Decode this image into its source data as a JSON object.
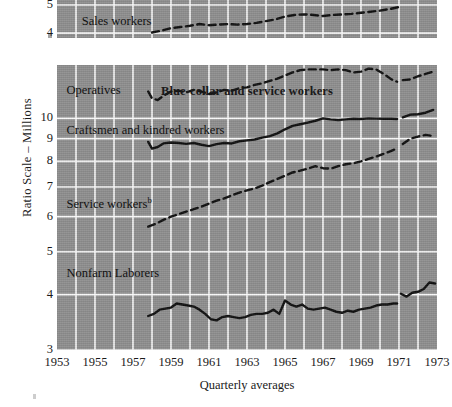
{
  "figure": {
    "y_axis_title": "Ratio Scale – Millions",
    "x_axis_caption": "Quarterly averages",
    "background_color": "#909090",
    "gridline_color": "#ffffff",
    "line_color": "#111111"
  },
  "panels": [
    {
      "id": "top",
      "title": "",
      "labels": [
        {
          "text": "Sales workers",
          "x": 1954.3,
          "y": 4.38
        }
      ],
      "y_ticks": [
        "5",
        "4"
      ],
      "y_tick_values": [
        5,
        4
      ],
      "clipped": true
    },
    {
      "id": "bottom",
      "title": "Blue-collar and service workers",
      "labels": [
        {
          "text": "Operatives",
          "x": 1953.5,
          "y": 11.55
        },
        {
          "text": "Craftsmen and kindred workers",
          "x": 1953.5,
          "y": 9.35
        },
        {
          "text": "Service workers",
          "superscript": "b",
          "x": 1953.5,
          "y": 6.45
        },
        {
          "text": "Nonfarm Laborers",
          "x": 1953.5,
          "y": 4.45
        }
      ],
      "y_ticks": [
        "10",
        "9",
        "8",
        "7",
        "6",
        "5",
        "4",
        "3"
      ],
      "y_tick_values": [
        10,
        9,
        8,
        7,
        6,
        5,
        4,
        3
      ]
    }
  ],
  "x_ticks": [
    "1953",
    "1955",
    "1957",
    "1959",
    "1961",
    "1963",
    "1965",
    "1967",
    "1969",
    "1971",
    "1973"
  ],
  "chart_data": {
    "type": "line",
    "title": "Blue-collar and service workers",
    "subtitle": "",
    "xlabel": "Quarterly averages",
    "ylabel": "Ratio Scale – Millions",
    "scale": "log",
    "grid": true,
    "legend": "inline-labels",
    "xlim": [
      1953,
      1973
    ],
    "x_ticks": [
      1953,
      1955,
      1957,
      1959,
      1961,
      1963,
      1965,
      1967,
      1969,
      1971,
      1973
    ],
    "panels": [
      {
        "name": "White-collar workers (clipped panel)",
        "ylim": [
          3.85,
          5.2
        ],
        "y_ticks": [
          4,
          5
        ],
        "series": [
          {
            "name": "Sales workers",
            "style": "dashed",
            "x": [
              1958.0,
              1958.5,
              1959.0,
              1959.5,
              1960.0,
              1960.5,
              1961.0,
              1961.5,
              1962.0,
              1962.5,
              1963.0,
              1963.5,
              1964.0,
              1964.5,
              1965.0,
              1965.5,
              1966.0,
              1966.5,
              1967.0,
              1967.5,
              1968.0,
              1968.5,
              1969.0,
              1969.5,
              1970.0,
              1970.5,
              1971.0
            ],
            "values": [
              4.02,
              4.08,
              4.16,
              4.2,
              4.24,
              4.3,
              4.26,
              4.28,
              4.3,
              4.28,
              4.3,
              4.34,
              4.4,
              4.46,
              4.56,
              4.62,
              4.64,
              4.62,
              4.58,
              4.62,
              4.64,
              4.66,
              4.7,
              4.74,
              4.78,
              4.84,
              4.92
            ]
          }
        ]
      },
      {
        "name": "Blue-collar and service workers",
        "ylim": [
          3.0,
          13.2
        ],
        "y_ticks": [
          3,
          4,
          5,
          6,
          7,
          8,
          9,
          10
        ],
        "series": [
          {
            "name": "Operatives",
            "style": "dashed",
            "break_year": 1971,
            "x": [
              1957.8,
              1958.0,
              1958.3,
              1958.6,
              1959.0,
              1959.4,
              1959.8,
              1960.2,
              1960.6,
              1961.0,
              1961.4,
              1961.8,
              1962.2,
              1962.6,
              1963.0,
              1963.4,
              1963.8,
              1964.2,
              1964.6,
              1965.0,
              1965.4,
              1965.8,
              1966.2,
              1966.6,
              1967.0,
              1967.4,
              1967.8,
              1968.2,
              1968.6,
              1969.0,
              1969.4,
              1969.8,
              1970.2,
              1970.6,
              1970.9
            ],
            "values": [
              11.5,
              11.1,
              11.0,
              11.25,
              11.5,
              11.55,
              11.45,
              11.6,
              11.5,
              11.35,
              11.45,
              11.6,
              11.55,
              11.7,
              11.75,
              11.9,
              12.0,
              12.15,
              12.3,
              12.5,
              12.7,
              12.85,
              12.9,
              12.9,
              12.9,
              12.85,
              12.9,
              12.85,
              12.7,
              12.75,
              12.95,
              12.9,
              12.6,
              12.25,
              12.1
            ],
            "x2": [
              1971.2,
              1971.6,
              1972.0,
              1972.4,
              1972.8
            ],
            "values2": [
              12.2,
              12.25,
              12.45,
              12.6,
              12.75
            ]
          },
          {
            "name": "Craftsmen and kindred workers",
            "style": "solid",
            "break_year": 1971,
            "x": [
              1957.8,
              1958.0,
              1958.3,
              1958.6,
              1959.0,
              1959.4,
              1959.8,
              1960.2,
              1960.6,
              1961.0,
              1961.4,
              1961.8,
              1962.2,
              1962.6,
              1963.0,
              1963.4,
              1963.8,
              1964.2,
              1964.6,
              1965.0,
              1965.4,
              1965.8,
              1966.2,
              1966.6,
              1967.0,
              1967.4,
              1967.8,
              1968.2,
              1968.6,
              1969.0,
              1969.4,
              1969.8,
              1970.2,
              1970.6,
              1970.9
            ],
            "values": [
              8.85,
              8.55,
              8.62,
              8.78,
              8.82,
              8.8,
              8.76,
              8.8,
              8.72,
              8.66,
              8.75,
              8.8,
              8.78,
              8.88,
              8.92,
              8.96,
              9.05,
              9.12,
              9.25,
              9.45,
              9.62,
              9.7,
              9.78,
              9.88,
              10.0,
              9.95,
              9.92,
              9.95,
              9.98,
              9.97,
              10.0,
              9.99,
              9.98,
              9.98,
              9.97
            ],
            "x2": [
              1971.2,
              1971.6,
              1972.0,
              1972.4,
              1972.8
            ],
            "values2": [
              10.05,
              10.2,
              10.22,
              10.3,
              10.45
            ]
          },
          {
            "name": "Service workers",
            "superscript": "b",
            "style": "dashed",
            "break_year": 1971,
            "x": [
              1957.8,
              1958.2,
              1958.6,
              1959.0,
              1959.4,
              1959.8,
              1960.2,
              1960.6,
              1961.0,
              1961.4,
              1961.8,
              1962.2,
              1962.6,
              1963.0,
              1963.4,
              1963.8,
              1964.2,
              1964.6,
              1965.0,
              1965.4,
              1965.8,
              1966.2,
              1966.6,
              1967.0,
              1967.4,
              1967.8,
              1968.2,
              1968.6,
              1969.0,
              1969.4,
              1969.8,
              1970.2,
              1970.6,
              1970.9
            ],
            "values": [
              5.7,
              5.78,
              5.9,
              6.0,
              6.08,
              6.16,
              6.24,
              6.32,
              6.42,
              6.52,
              6.6,
              6.7,
              6.8,
              6.88,
              6.95,
              7.05,
              7.18,
              7.3,
              7.42,
              7.55,
              7.62,
              7.7,
              7.8,
              7.72,
              7.7,
              7.8,
              7.88,
              7.92,
              8.0,
              8.1,
              8.2,
              8.32,
              8.45,
              8.55
            ],
            "x2": [
              1971.2,
              1971.6,
              1972.0,
              1972.4,
              1972.8
            ],
            "values2": [
              8.75,
              9.0,
              9.1,
              9.18,
              9.12
            ]
          },
          {
            "name": "Nonfarm Laborers",
            "style": "solid",
            "break_year": 1971,
            "x": [
              1957.8,
              1958.1,
              1958.4,
              1958.7,
              1959.0,
              1959.3,
              1959.6,
              1959.9,
              1960.2,
              1960.5,
              1960.8,
              1961.1,
              1961.4,
              1961.7,
              1962.0,
              1962.3,
              1962.6,
              1962.9,
              1963.2,
              1963.5,
              1963.8,
              1964.1,
              1964.4,
              1964.7,
              1965.0,
              1965.3,
              1965.6,
              1965.9,
              1966.2,
              1966.5,
              1966.8,
              1967.1,
              1967.4,
              1967.7,
              1968.0,
              1968.3,
              1968.6,
              1968.9,
              1969.2,
              1969.5,
              1969.8,
              1970.1,
              1970.4,
              1970.7,
              1970.9
            ],
            "values": [
              3.58,
              3.62,
              3.7,
              3.72,
              3.74,
              3.82,
              3.8,
              3.78,
              3.76,
              3.7,
              3.62,
              3.52,
              3.5,
              3.56,
              3.58,
              3.56,
              3.54,
              3.56,
              3.6,
              3.62,
              3.62,
              3.64,
              3.7,
              3.62,
              3.88,
              3.8,
              3.76,
              3.8,
              3.72,
              3.7,
              3.72,
              3.74,
              3.7,
              3.66,
              3.64,
              3.68,
              3.66,
              3.7,
              3.72,
              3.74,
              3.78,
              3.8,
              3.8,
              3.82,
              3.82
            ],
            "x2": [
              1971.1,
              1971.4,
              1971.7,
              1972.0,
              1972.3,
              1972.6,
              1972.9
            ],
            "values2": [
              4.02,
              3.96,
              4.04,
              4.06,
              4.12,
              4.26,
              4.24
            ]
          }
        ]
      }
    ]
  }
}
